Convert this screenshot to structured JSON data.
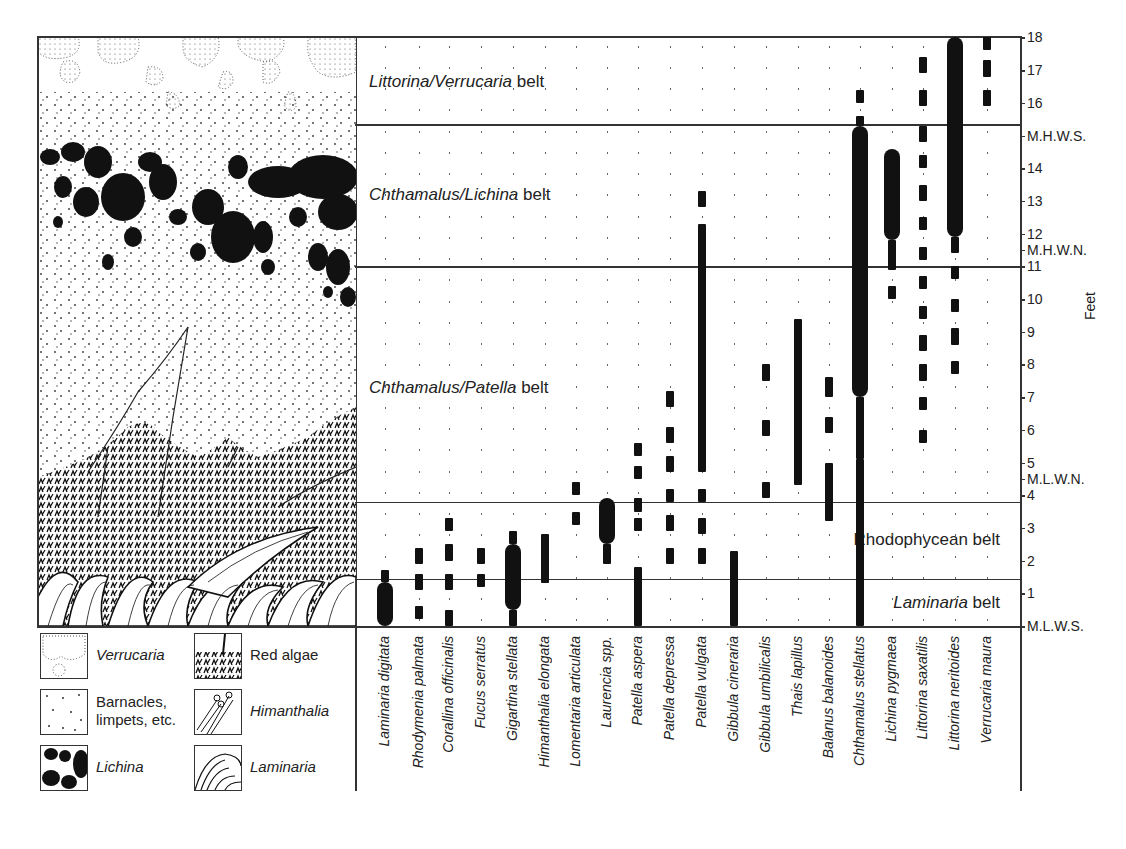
{
  "figure": {
    "axis_label": "Feet",
    "tide_marks": [
      {
        "label": "18",
        "ft": 18
      },
      {
        "label": "17",
        "ft": 17
      },
      {
        "label": "16",
        "ft": 16
      },
      {
        "label": "M.H.W.S.",
        "ft": 15
      },
      {
        "label": "14",
        "ft": 14
      },
      {
        "label": "13",
        "ft": 13
      },
      {
        "label": "12",
        "ft": 12
      },
      {
        "label": "M.H.W.N.",
        "ft": 11.5
      },
      {
        "label": "11",
        "ft": 11
      },
      {
        "label": "10",
        "ft": 10
      },
      {
        "label": "9",
        "ft": 9
      },
      {
        "label": "8",
        "ft": 8
      },
      {
        "label": "7",
        "ft": 7
      },
      {
        "label": "6",
        "ft": 6
      },
      {
        "label": "5",
        "ft": 5
      },
      {
        "label": "M.L.W.N.",
        "ft": 4.5
      },
      {
        "label": "4",
        "ft": 4
      },
      {
        "label": "3",
        "ft": 3
      },
      {
        "label": "2",
        "ft": 2
      },
      {
        "label": "1",
        "ft": 1
      },
      {
        "label": "M.L.W.S.",
        "ft": 0
      }
    ],
    "belts": [
      {
        "italic": "Littorina / Verrucaria",
        "plain": " belt",
        "top_ft": 18,
        "bottom_ft": 15.35,
        "label_y": 82
      },
      {
        "italic": "Chthamalus / Lichina",
        "plain": " belt",
        "top_ft": 15.35,
        "bottom_ft": 11,
        "label_y": 195
      },
      {
        "italic": "Chthamalus / Patella",
        "plain": " belt",
        "top_ft": 11,
        "bottom_ft": 3.8,
        "label_y": 388
      },
      {
        "italic": "",
        "plain": "Rhodophycean belt",
        "top_ft": 3.8,
        "bottom_ft": 1.45,
        "label_y": 540,
        "align": "right"
      },
      {
        "italic": "Laminaria",
        "plain": " belt",
        "top_ft": 1.45,
        "bottom_ft": 0,
        "label_y": 603,
        "align": "right"
      }
    ]
  },
  "legend": [
    {
      "label": "Verrucaria",
      "italic": true,
      "pattern": "verrucaria"
    },
    {
      "label": "Red algae",
      "italic": false,
      "pattern": "red-algae"
    },
    {
      "label": "Barnacles,\nlimpets, etc.",
      "italic": false,
      "pattern": "barnacles"
    },
    {
      "label": "Himanthalia",
      "italic": true,
      "pattern": "himanthalia"
    },
    {
      "label": "Lichina",
      "italic": true,
      "pattern": "lichina"
    },
    {
      "label": "Laminaria",
      "italic": true,
      "pattern": "laminaria"
    }
  ],
  "chart_data": {
    "type": "range-bar (zonation diagram)",
    "ylabel": "Feet",
    "ylim": [
      0,
      18
    ],
    "y_reference_levels": {
      "M.L.W.S.": 0,
      "M.L.W.N.": 4.5,
      "M.H.W.N.": 11.5,
      "M.H.W.S.": 15
    },
    "legend_key": {
      "thick": "abundant",
      "solid": "common",
      "dashed": "occasional / rare",
      "dotted": "absent / scattered"
    },
    "species": [
      {
        "name": "Laminaria digitata",
        "x": 385,
        "segments": [
          {
            "from": 0,
            "to": 1.35,
            "w": "thick"
          },
          {
            "from": 1.35,
            "to": 1.7,
            "w": "solid"
          }
        ]
      },
      {
        "name": "Rhodymenia palmata",
        "x": 419,
        "segments": [
          {
            "from": 0.2,
            "to": 0.6,
            "w": "dash"
          },
          {
            "from": 1.1,
            "to": 1.6,
            "w": "dash"
          },
          {
            "from": 1.9,
            "to": 2.4,
            "w": "dash"
          }
        ]
      },
      {
        "name": "Corallina officinalis",
        "x": 449,
        "segments": [
          {
            "from": 0,
            "to": 0.5,
            "w": "dash"
          },
          {
            "from": 1.1,
            "to": 1.6,
            "w": "dash"
          },
          {
            "from": 2,
            "to": 2.5,
            "w": "dash"
          },
          {
            "from": 2.9,
            "to": 3.3,
            "w": "dash"
          }
        ]
      },
      {
        "name": "Fucus serratus",
        "x": 481,
        "segments": [
          {
            "from": 1.2,
            "to": 1.6,
            "w": "dash"
          },
          {
            "from": 1.9,
            "to": 2.4,
            "w": "dash"
          }
        ]
      },
      {
        "name": "Gigartina stellata",
        "x": 513,
        "segments": [
          {
            "from": 0,
            "to": 0.5,
            "w": "solid"
          },
          {
            "from": 0.5,
            "to": 2.5,
            "w": "thick"
          },
          {
            "from": 2.5,
            "to": 2.9,
            "w": "solid"
          }
        ]
      },
      {
        "name": "Himanthalia elongata",
        "x": 545,
        "segments": [
          {
            "from": 1.3,
            "to": 2.8,
            "w": "solid"
          }
        ]
      },
      {
        "name": "Lomentaria articulata",
        "x": 576,
        "segments": [
          {
            "from": 3.1,
            "to": 3.5,
            "w": "dash"
          },
          {
            "from": 4,
            "to": 4.4,
            "w": "dash"
          }
        ]
      },
      {
        "name": "Laurencia spp.",
        "x": 607,
        "segments": [
          {
            "from": 1.9,
            "to": 2.5,
            "w": "solid"
          },
          {
            "from": 2.5,
            "to": 3.9,
            "w": "thick"
          }
        ]
      },
      {
        "name": "Patella aspera",
        "x": 638,
        "segments": [
          {
            "from": 0,
            "to": 1.8,
            "w": "solid"
          },
          {
            "from": 2.9,
            "to": 3.3,
            "w": "dash"
          },
          {
            "from": 3.5,
            "to": 3.9,
            "w": "dash"
          },
          {
            "from": 4.5,
            "to": 4.9,
            "w": "dash"
          },
          {
            "from": 5.2,
            "to": 5.6,
            "w": "dash"
          }
        ]
      },
      {
        "name": "Patella depressa",
        "x": 670,
        "segments": [
          {
            "from": 1.9,
            "to": 2.4,
            "w": "dash"
          },
          {
            "from": 2.9,
            "to": 3.4,
            "w": "dash"
          },
          {
            "from": 3.8,
            "to": 4.2,
            "w": "dash"
          },
          {
            "from": 4.7,
            "to": 5.2,
            "w": "dash"
          },
          {
            "from": 5.6,
            "to": 6.1,
            "w": "dash"
          },
          {
            "from": 6.7,
            "to": 7.2,
            "w": "dash"
          }
        ]
      },
      {
        "name": "Patella vulgata",
        "x": 702,
        "segments": [
          {
            "from": 1.9,
            "to": 2.4,
            "w": "dash"
          },
          {
            "from": 2.8,
            "to": 3.3,
            "w": "dash"
          },
          {
            "from": 3.8,
            "to": 4.2,
            "w": "dash"
          },
          {
            "from": 4.7,
            "to": 12.3,
            "w": "solid"
          },
          {
            "from": 12.8,
            "to": 13.3,
            "w": "dash"
          }
        ]
      },
      {
        "name": "Gibbula cineraria",
        "x": 734,
        "segments": [
          {
            "from": 0,
            "to": 2.3,
            "w": "solid"
          }
        ]
      },
      {
        "name": "Gibbula umbilicalis",
        "x": 766,
        "segments": [
          {
            "from": 3.9,
            "to": 4.4,
            "w": "dash"
          },
          {
            "from": 5.8,
            "to": 6.3,
            "w": "dash"
          },
          {
            "from": 7.5,
            "to": 8,
            "w": "dash"
          }
        ]
      },
      {
        "name": "Thais lapillus",
        "x": 798,
        "segments": [
          {
            "from": 4.3,
            "to": 9.4,
            "w": "solid"
          }
        ]
      },
      {
        "name": "Balanus balanoides",
        "x": 829,
        "segments": [
          {
            "from": 3.2,
            "to": 5,
            "w": "solid"
          },
          {
            "from": 5.9,
            "to": 6.4,
            "w": "dash"
          },
          {
            "from": 7,
            "to": 7.6,
            "w": "dash"
          }
        ]
      },
      {
        "name": "Chthamalus stellatus",
        "x": 860,
        "segments": [
          {
            "from": 0,
            "to": 5.1,
            "w": "solid"
          },
          {
            "from": 5.1,
            "to": 7,
            "w": "solid"
          },
          {
            "from": 5.6,
            "to": 6.1,
            "w": "dash"
          },
          {
            "from": 7,
            "to": 15.3,
            "w": "thick"
          },
          {
            "from": 15.3,
            "to": 15.6,
            "w": "solid"
          },
          {
            "from": 16,
            "to": 16.4,
            "w": "dash"
          }
        ]
      },
      {
        "name": "Lichina pygmaea",
        "x": 892,
        "segments": [
          {
            "from": 10,
            "to": 10.4,
            "w": "dash"
          },
          {
            "from": 10.9,
            "to": 11.8,
            "w": "solid"
          },
          {
            "from": 11.8,
            "to": 14.6,
            "w": "thick"
          }
        ]
      },
      {
        "name": "Littorina saxatilis",
        "x": 923,
        "segments": [
          {
            "from": 5.6,
            "to": 6,
            "w": "dash"
          },
          {
            "from": 6.6,
            "to": 7,
            "w": "dash"
          },
          {
            "from": 7.5,
            "to": 8,
            "w": "dash"
          },
          {
            "from": 8.4,
            "to": 8.9,
            "w": "dash"
          },
          {
            "from": 9.4,
            "to": 9.8,
            "w": "dash"
          },
          {
            "from": 10.3,
            "to": 10.7,
            "w": "dash"
          },
          {
            "from": 11.2,
            "to": 11.6,
            "w": "dash"
          },
          {
            "from": 12.1,
            "to": 12.5,
            "w": "dash"
          },
          {
            "from": 13,
            "to": 13.5,
            "w": "dash"
          },
          {
            "from": 14,
            "to": 14.4,
            "w": "dash"
          },
          {
            "from": 14.8,
            "to": 15.3,
            "w": "dash"
          },
          {
            "from": 15.9,
            "to": 16.4,
            "w": "dash"
          },
          {
            "from": 16.9,
            "to": 17.4,
            "w": "dash"
          }
        ]
      },
      {
        "name": "Littorina neritoides",
        "x": 955,
        "segments": [
          {
            "from": 7.7,
            "to": 8.1,
            "w": "dash"
          },
          {
            "from": 8.6,
            "to": 9.1,
            "w": "dash"
          },
          {
            "from": 9.6,
            "to": 10,
            "w": "dash"
          },
          {
            "from": 10.6,
            "to": 11,
            "w": "dash"
          },
          {
            "from": 11.4,
            "to": 11.9,
            "w": "solid"
          },
          {
            "from": 11.9,
            "to": 18,
            "w": "thick"
          }
        ]
      },
      {
        "name": "Verrucaria maura",
        "x": 987,
        "segments": [
          {
            "from": 15.9,
            "to": 16.4,
            "w": "dash"
          },
          {
            "from": 16.8,
            "to": 17.3,
            "w": "dash"
          },
          {
            "from": 17.6,
            "to": 18,
            "w": "dash"
          }
        ]
      }
    ]
  }
}
